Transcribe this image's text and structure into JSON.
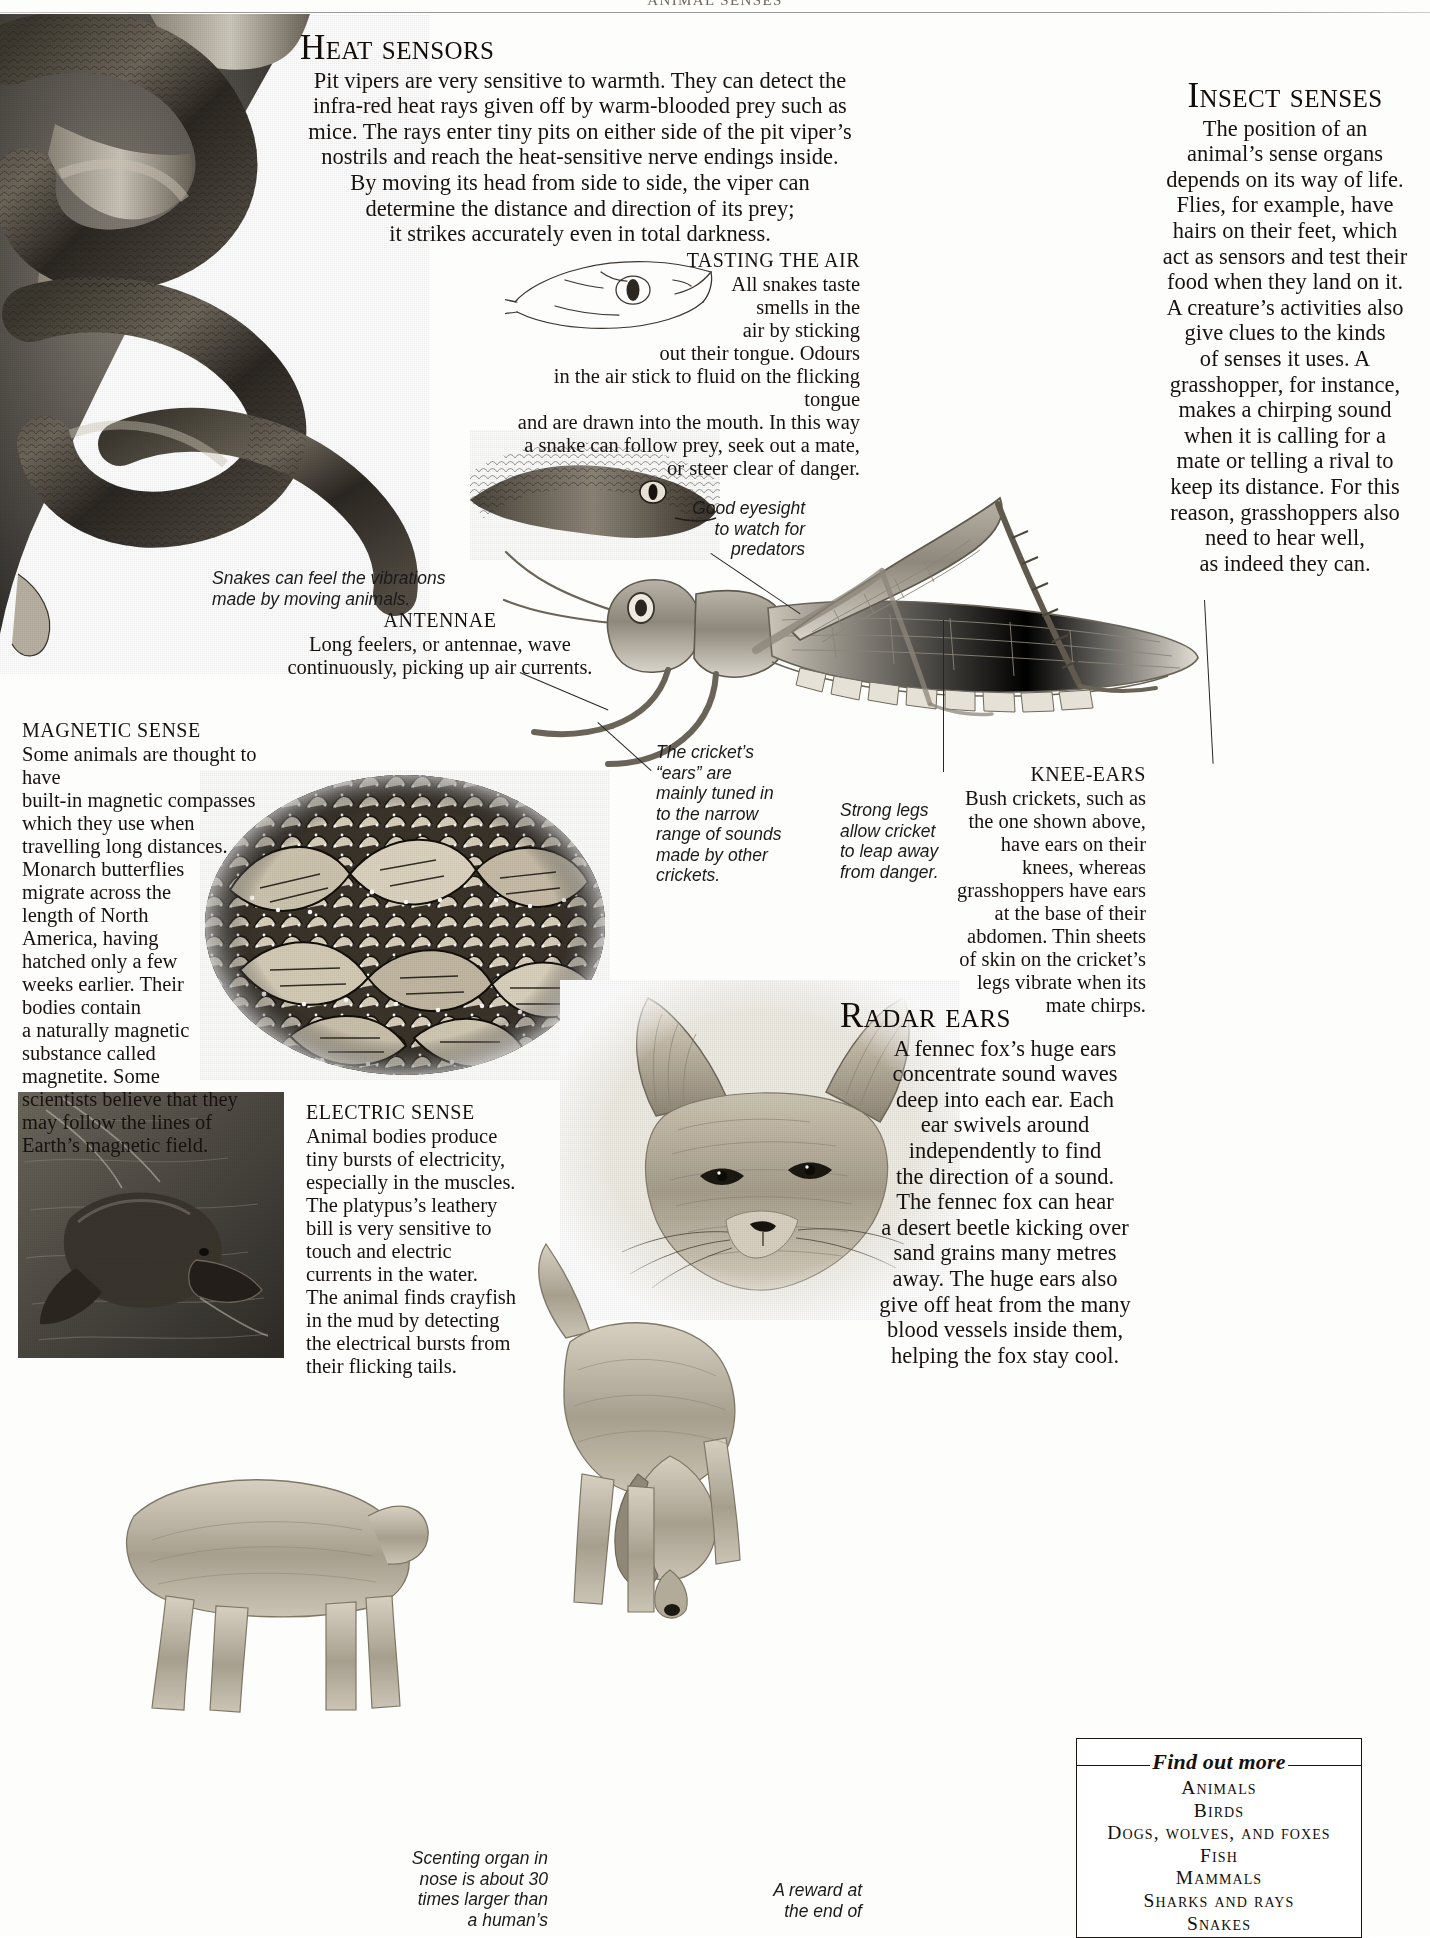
{
  "running_head": "ANIMAL SENSES",
  "sections": {
    "heat_sensors": {
      "title": "Heat sensors",
      "body": "Pit vipers are very sensitive to warmth. They can detect the infra-red heat rays given off by warm-blooded prey such as mice. The rays enter tiny pits on either side of the pit viper’s nostrils and reach the heat-sensitive nerve endings inside. By moving its head from side to side, the viper can determine the distance and direction of its prey; it strikes accurately even in total darkness.",
      "lines": [
        "Pit vipers are very sensitive to warmth. They can detect the",
        "infra-red heat rays given off by warm-blooded prey such as",
        "mice. The rays enter tiny pits on either side of the pit viper’s",
        "nostrils and reach the heat-sensitive nerve endings inside.",
        "By moving its head from side to side, the viper can",
        "determine the distance and direction of its prey;",
        "it strikes accurately even in total darkness."
      ]
    },
    "tasting_the_air": {
      "title": "TASTING THE AIR",
      "lines": [
        "All snakes taste",
        "smells in the",
        "air by sticking",
        "out their tongue. Odours",
        "in the air stick to fluid on the flicking tongue",
        "and are drawn into the mouth. In this way",
        "a snake can follow prey, seek out a mate,",
        "or steer clear of danger."
      ],
      "body": "All snakes taste smells in the air by sticking out their tongue. Odours in the air stick to fluid on the flicking tongue and are drawn into the mouth. In this way a snake can follow prey, seek out a mate, or steer clear of danger."
    },
    "insect_senses": {
      "title": "Insect senses",
      "lines": [
        "The position of an",
        "animal’s sense organs",
        "depends on its way of life.",
        "Flies, for example, have",
        "hairs on their feet, which",
        "act as sensors and test their",
        "food when they land on it.",
        "A creature’s activities also",
        "give clues to the kinds",
        "of senses it uses. A",
        "grasshopper, for instance,",
        "makes a chirping sound",
        "when it is calling for a",
        "mate or telling a rival to",
        "keep its distance. For this",
        "reason, grasshoppers also",
        "need to hear well,",
        "as indeed they can."
      ],
      "body": "The position of an animal’s sense organs depends on its way of life. Flies, for example, have hairs on their feet, which act as sensors and test their food when they land on it. A creature’s activities also give clues to the kinds of senses it uses. A grasshopper, for instance, makes a chirping sound when it is calling for a mate or telling a rival to keep its distance. For this reason, grasshoppers also need to hear well, as indeed they can."
    },
    "antennae": {
      "title": "ANTENNAE",
      "lines": [
        "Long feelers, or antennae, wave",
        "continuously, picking up air currents."
      ],
      "body": "Long feelers, or antennae, wave continuously, picking up air currents."
    },
    "knee_ears": {
      "title": "KNEE-EARS",
      "lines": [
        "Bush crickets, such as",
        "the one shown above,",
        "have ears on their",
        "knees, whereas",
        "grasshoppers have ears",
        "at the base of their",
        "abdomen. Thin sheets",
        "of skin on the cricket’s",
        "legs vibrate when its",
        "mate chirps."
      ],
      "body": "Bush crickets, such as the one shown above, have ears on their knees, whereas grasshoppers have ears at the base of their abdomen. Thin sheets of skin on the cricket’s legs vibrate when its mate chirps."
    },
    "magnetic_sense": {
      "title": "MAGNETIC SENSE",
      "lines": [
        "Some animals are thought to have",
        "built-in magnetic compasses",
        "which they use when",
        "travelling long distances.",
        "Monarch butterflies",
        "migrate across the",
        "length of North",
        "America, having",
        "hatched only a few",
        "weeks earlier. Their",
        "bodies contain",
        "a naturally magnetic",
        "substance called",
        "magnetite. Some",
        "scientists believe that they",
        "may follow the lines of",
        "Earth’s magnetic field."
      ],
      "body": "Some animals are thought to have built-in magnetic compasses which they use when travelling long distances. Monarch butterflies migrate across the length of North America, having hatched only a few weeks earlier. Their bodies contain a naturally magnetic substance called magnetite. Some scientists believe that they may follow the lines of Earth’s magnetic field."
    },
    "electric_sense": {
      "title": "ELECTRIC SENSE",
      "lines": [
        "Animal bodies produce",
        "tiny bursts of electricity,",
        "especially in the muscles.",
        "The platypus’s leathery",
        "bill is very sensitive to",
        "touch and electric",
        "currents in the water.",
        "The animal finds crayfish",
        "in the mud by detecting",
        "the electrical bursts from",
        "their flicking tails."
      ],
      "body": "Animal bodies produce tiny bursts of electricity, especially in the muscles. The platypus’s leathery bill is very sensitive to touch and electric currents in the water. The animal finds crayfish in the mud by detecting the electrical bursts from their flicking tails."
    },
    "radar_ears": {
      "title": "Radar ears",
      "lines": [
        "A fennec fox’s huge ears",
        "concentrate sound waves",
        "deep into each ear. Each",
        "ear swivels around",
        "independently to find",
        "the direction of a sound.",
        "The fennec fox can hear",
        "a desert beetle kicking over",
        "sand grains many metres",
        "away. The huge ears also",
        "give off heat from the many",
        "blood vessels inside them,",
        "helping the fox stay cool."
      ],
      "body": "A fennec fox’s huge ears concentrate sound waves deep into each ear. Each ear swivels around independently to find the direction of a sound. The fennec fox can hear a desert beetle kicking over sand grains many metres away. The huge ears also give off heat from the many blood vessels inside them, helping the fox stay cool."
    }
  },
  "callouts": {
    "snake_vibrations": {
      "lines": [
        "Snakes can feel the vibrations",
        "made by moving animals."
      ],
      "text": "Snakes can feel the vibrations made by moving animals."
    },
    "good_eyesight": {
      "lines": [
        "Good eyesight",
        "to watch for",
        "predators"
      ],
      "text": "Good eyesight to watch for predators"
    },
    "cricket_ears": {
      "lines": [
        "The cricket’s",
        "“ears” are",
        "mainly tuned in",
        "to the narrow",
        "range of sounds",
        "made by other",
        "crickets."
      ],
      "text": "The cricket’s “ears” are mainly tuned in to the narrow range of sounds made by other crickets."
    },
    "strong_legs": {
      "lines": [
        "Strong legs",
        "allow cricket",
        "to leap away",
        "from danger."
      ],
      "text": "Strong legs allow cricket to leap away from danger."
    },
    "scenting_organ": {
      "lines": [
        "Scenting organ in",
        "nose is about 30",
        "times larger than",
        "a human’s"
      ],
      "text": "Scenting organ in nose is about 30 times larger than a human’s"
    },
    "reward": {
      "lines": [
        "A reward at",
        "the end of"
      ],
      "text": "A reward at the end of"
    }
  },
  "find_out_more": {
    "title": "Find out more",
    "items": [
      "Animals",
      "Birds",
      "Dogs, wolves, and foxes",
      "Fish",
      "Mammals",
      "Sharks and rays",
      "Snakes"
    ]
  },
  "illustrations": {
    "snake_photo": "tree-snake-photograph",
    "snake_head_drawing": "snake-head-line-drawing",
    "grasshopper_drawing": "grasshopper-illustration",
    "butterflies_photo": "monarch-butterfly-cluster-photograph",
    "platypus_photo": "platypus-photograph",
    "fennec_photo": "fennec-fox-photograph",
    "dog_left": "bloodhound-illustration-left",
    "dog_right": "bloodhound-illustration-right"
  },
  "colors": {
    "ink": "#16110d",
    "rule": "#1a1512",
    "paper": "#fdfdfc"
  }
}
